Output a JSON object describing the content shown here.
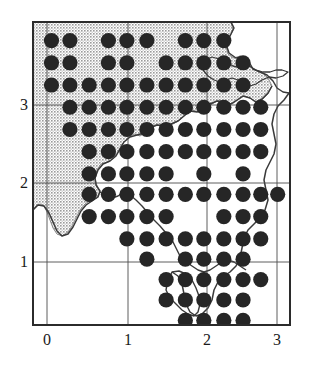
{
  "figure": {
    "type": "distribution-dot-map",
    "title": ""
  },
  "axes": {
    "x": {
      "label": "",
      "ticks": [
        "0",
        "1",
        "2",
        "3"
      ],
      "tick_values": [
        0,
        1,
        2,
        3
      ],
      "range": [
        -0.18,
        3.16
      ]
    },
    "y": {
      "label": "",
      "ticks": [
        "1",
        "2",
        "3"
      ],
      "tick_values": [
        1,
        2,
        3
      ],
      "range": [
        0.45,
        3.72
      ]
    },
    "grid": true,
    "frame": true
  },
  "style": {
    "dot_color": "#262626",
    "shade_color": "#c9c9c9",
    "frame_color": "#2b2b2b",
    "grid_color": "#555555",
    "coast_color": "#333333",
    "background": "#ffffff",
    "dot_radius_px": 7.6
  },
  "chart_data": {
    "type": "scatter",
    "title": "",
    "xlabel": "",
    "ylabel": "",
    "xlim": [
      -0.18,
      3.16
    ],
    "ylim": [
      0.45,
      3.72
    ],
    "legend": [],
    "categories": [],
    "series": [
      {
        "name": "presence",
        "marker": "filled-circle",
        "points": [
          [
            0.06,
            3.52
          ],
          [
            0.3,
            3.52
          ],
          [
            0.8,
            3.52
          ],
          [
            1.04,
            3.52
          ],
          [
            1.3,
            3.52
          ],
          [
            1.8,
            3.52
          ],
          [
            2.04,
            3.52
          ],
          [
            2.3,
            3.52
          ],
          [
            0.06,
            3.28
          ],
          [
            0.3,
            3.28
          ],
          [
            0.8,
            3.28
          ],
          [
            1.04,
            3.28
          ],
          [
            1.55,
            3.28
          ],
          [
            1.8,
            3.28
          ],
          [
            2.04,
            3.28
          ],
          [
            2.3,
            3.28
          ],
          [
            2.55,
            3.28
          ],
          [
            0.06,
            3.04
          ],
          [
            0.3,
            3.04
          ],
          [
            0.55,
            3.04
          ],
          [
            0.8,
            3.04
          ],
          [
            1.04,
            3.04
          ],
          [
            1.3,
            3.04
          ],
          [
            1.55,
            3.04
          ],
          [
            1.8,
            3.04
          ],
          [
            2.04,
            3.04
          ],
          [
            2.3,
            3.04
          ],
          [
            2.55,
            3.04
          ],
          [
            0.3,
            2.8
          ],
          [
            0.55,
            2.8
          ],
          [
            0.8,
            2.8
          ],
          [
            1.04,
            2.8
          ],
          [
            1.3,
            2.8
          ],
          [
            1.55,
            2.8
          ],
          [
            1.8,
            2.8
          ],
          [
            2.04,
            2.8
          ],
          [
            2.3,
            2.8
          ],
          [
            2.55,
            2.8
          ],
          [
            2.78,
            2.8
          ],
          [
            0.3,
            2.56
          ],
          [
            0.55,
            2.56
          ],
          [
            0.8,
            2.56
          ],
          [
            1.04,
            2.56
          ],
          [
            1.3,
            2.56
          ],
          [
            1.55,
            2.56
          ],
          [
            1.8,
            2.56
          ],
          [
            2.04,
            2.56
          ],
          [
            2.3,
            2.56
          ],
          [
            2.55,
            2.56
          ],
          [
            2.78,
            2.56
          ],
          [
            0.55,
            2.32
          ],
          [
            0.8,
            2.32
          ],
          [
            1.04,
            2.32
          ],
          [
            1.3,
            2.32
          ],
          [
            1.55,
            2.32
          ],
          [
            1.8,
            2.32
          ],
          [
            2.04,
            2.32
          ],
          [
            2.3,
            2.32
          ],
          [
            2.55,
            2.32
          ],
          [
            2.78,
            2.32
          ],
          [
            0.55,
            2.08
          ],
          [
            0.8,
            2.08
          ],
          [
            1.04,
            2.08
          ],
          [
            1.3,
            2.08
          ],
          [
            1.55,
            2.08
          ],
          [
            2.04,
            2.08
          ],
          [
            2.55,
            2.08
          ],
          [
            0.55,
            1.86
          ],
          [
            0.8,
            1.86
          ],
          [
            1.04,
            1.86
          ],
          [
            1.3,
            1.86
          ],
          [
            1.55,
            1.86
          ],
          [
            1.8,
            1.86
          ],
          [
            2.04,
            1.86
          ],
          [
            2.3,
            1.86
          ],
          [
            2.55,
            1.86
          ],
          [
            2.78,
            1.86
          ],
          [
            3.0,
            1.86
          ],
          [
            0.55,
            1.62
          ],
          [
            0.8,
            1.62
          ],
          [
            1.04,
            1.62
          ],
          [
            1.3,
            1.62
          ],
          [
            1.55,
            1.62
          ],
          [
            2.3,
            1.62
          ],
          [
            2.55,
            1.62
          ],
          [
            2.78,
            1.62
          ],
          [
            1.04,
            1.38
          ],
          [
            1.3,
            1.38
          ],
          [
            1.55,
            1.38
          ],
          [
            1.8,
            1.38
          ],
          [
            2.04,
            1.38
          ],
          [
            2.3,
            1.38
          ],
          [
            2.55,
            1.38
          ],
          [
            2.78,
            1.38
          ],
          [
            1.3,
            1.16
          ],
          [
            1.8,
            1.16
          ],
          [
            2.04,
            1.16
          ],
          [
            2.3,
            1.16
          ],
          [
            2.55,
            1.16
          ],
          [
            1.55,
            0.94
          ],
          [
            1.8,
            0.94
          ],
          [
            2.04,
            0.94
          ],
          [
            2.3,
            0.94
          ],
          [
            2.55,
            0.94
          ],
          [
            2.78,
            0.94
          ],
          [
            1.55,
            0.72
          ],
          [
            1.8,
            0.72
          ],
          [
            2.04,
            0.72
          ],
          [
            2.3,
            0.72
          ],
          [
            2.55,
            0.72
          ],
          [
            1.8,
            0.5
          ],
          [
            2.04,
            0.5
          ],
          [
            2.3,
            0.5
          ],
          [
            2.55,
            0.5
          ],
          [
            2.04,
            0.3
          ]
        ]
      }
    ],
    "annotations": []
  }
}
